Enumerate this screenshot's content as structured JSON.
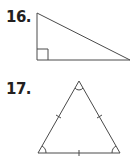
{
  "problems": [
    {
      "number": "16.",
      "figure": "right-triangle",
      "marks": [
        "right-angle-marker"
      ]
    },
    {
      "number": "17.",
      "figure": "equilateral-triangle",
      "marks": [
        "tick-left-side",
        "tick-right-side",
        "tick-base",
        "angle-arc-top",
        "angle-arc-bottom-left",
        "angle-arc-bottom-right"
      ]
    }
  ],
  "colors": {
    "stroke": "#4a4a4a",
    "text": "#231f20"
  }
}
